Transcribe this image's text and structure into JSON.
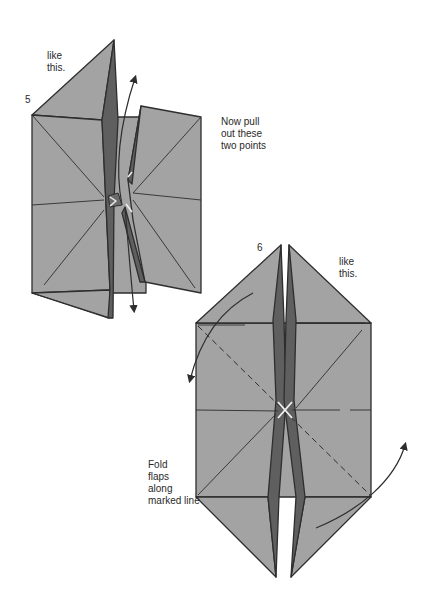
{
  "diagram": {
    "type": "origami-instructions",
    "colors": {
      "paper": "#a3a3a3",
      "dark_strip": "#5f5f5f",
      "outline": "#2e2e2e",
      "background": "#ffffff",
      "highlight": "#e8e8e8"
    },
    "steps": [
      {
        "number": "5",
        "caption": "like\nthis.",
        "instruction": "Now pull\nout these\ntwo points"
      },
      {
        "number": "6",
        "caption": "like\nthis.",
        "instruction": "Fold\nflaps\nalong\nmarked line"
      }
    ]
  }
}
